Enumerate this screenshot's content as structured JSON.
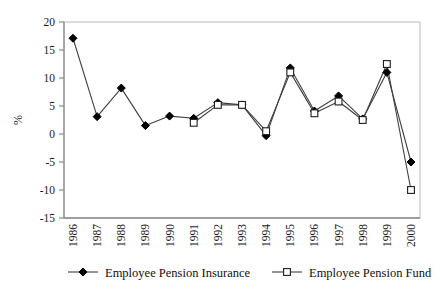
{
  "chart_data": {
    "type": "line",
    "title": "",
    "xlabel": "",
    "ylabel": "%",
    "categories": [
      "1986",
      "1987",
      "1988",
      "1989",
      "1990",
      "1991",
      "1992",
      "1993",
      "1994",
      "1995",
      "1996",
      "1997",
      "1998",
      "1999",
      "2000"
    ],
    "ylim": [
      -15,
      20
    ],
    "y_ticks": [
      20,
      15,
      10,
      5,
      0,
      -5,
      -10,
      -15
    ],
    "y_tick_labels": [
      "20",
      "15",
      "10",
      "5",
      "0",
      "-5",
      "-10",
      "-15"
    ],
    "grid": false,
    "legend_position": "bottom",
    "series": [
      {
        "name": "Employee Pension Insurance",
        "marker": "filled-diamond",
        "values": [
          17.1,
          3.1,
          8.2,
          1.5,
          3.2,
          2.8,
          5.6,
          5.2,
          -0.3,
          11.8,
          4.1,
          6.8,
          2.7,
          11.0,
          -5.0
        ]
      },
      {
        "name": "Employee Pension Fund",
        "marker": "open-square",
        "values": [
          null,
          null,
          null,
          null,
          null,
          2.0,
          5.2,
          5.2,
          0.5,
          11.0,
          3.7,
          5.8,
          2.5,
          12.5,
          -10.0
        ]
      }
    ]
  },
  "legend": {
    "items": [
      {
        "label": "Employee Pension Insurance",
        "marker": "filled-diamond"
      },
      {
        "label": "Employee Pension Fund",
        "marker": "open-square"
      }
    ]
  },
  "colors": {
    "line": "#3f3f3f",
    "marker_fill": "#000000",
    "marker_open_fill": "#ffffff",
    "axis": "#8a8a8a",
    "text": "#111111"
  }
}
